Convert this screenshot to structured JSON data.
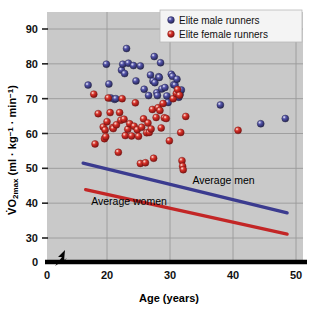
{
  "chart_data": {
    "type": "scatter",
    "title": "",
    "xlabel": "Age (years)",
    "ylabel": "VO2max (ml · kg-1 · min-1)",
    "ylabel_parts": {
      "v": "V",
      "o": "O",
      "sub": "2max",
      "rest": " (ml · kg",
      "sup1": "-1",
      "mid": " · min",
      "sup2": "-1",
      "close": ")"
    },
    "xlim": [
      0,
      51
    ],
    "ylim": [
      0,
      95
    ],
    "x_break_after": 0,
    "y_break_after": 0,
    "xticks": [
      0,
      20,
      30,
      40,
      50
    ],
    "xtick_labels": [
      "0",
      "20",
      "30",
      "40",
      "50"
    ],
    "yticks": [
      0,
      30,
      40,
      50,
      60,
      70,
      80,
      90
    ],
    "ytick_labels": [
      "0",
      "30",
      "40",
      "50",
      "60",
      "70",
      "80",
      "90"
    ],
    "grid": true,
    "grid_color": "#9a9a9a",
    "plot_background": "#c9c9c9",
    "legend_position": "top-right",
    "legend": [
      {
        "name": "Elite male runners",
        "color": "#3b3b8f"
      },
      {
        "name": "Elite female runners",
        "color": "#c32626"
      }
    ],
    "annotations": [
      {
        "text": "Average men",
        "x": 38.5,
        "y": 45.5
      },
      {
        "text": "Average women",
        "x": 23.5,
        "y": 39.5
      }
    ],
    "series": [
      {
        "name": "Elite male runners",
        "color": "#3b3b8f",
        "points": [
          [
            17.0,
            73.9
          ],
          [
            19.9,
            79.9
          ],
          [
            20.3,
            74.2
          ],
          [
            20.6,
            70.2
          ],
          [
            21.2,
            69.8
          ],
          [
            21.4,
            70.0
          ],
          [
            22.3,
            78.2
          ],
          [
            22.5,
            79.9
          ],
          [
            22.8,
            77.2
          ],
          [
            23.1,
            84.4
          ],
          [
            23.4,
            80.2
          ],
          [
            24.2,
            79.5
          ],
          [
            24.6,
            75.1
          ],
          [
            25.3,
            79.4
          ],
          [
            25.9,
            72.7
          ],
          [
            26.6,
            70.9
          ],
          [
            26.9,
            76.8
          ],
          [
            27.3,
            75.1
          ],
          [
            27.5,
            82.1
          ],
          [
            27.6,
            74.6
          ],
          [
            27.9,
            71.7
          ],
          [
            28.0,
            70.9
          ],
          [
            28.2,
            76.3
          ],
          [
            28.3,
            76.1
          ],
          [
            28.5,
            80.3
          ],
          [
            28.7,
            72.8
          ],
          [
            29.2,
            73.2
          ],
          [
            29.5,
            70.8
          ],
          [
            29.7,
            68.9
          ],
          [
            30.2,
            77.0
          ],
          [
            30.4,
            76.4
          ],
          [
            30.6,
            74.0
          ],
          [
            30.8,
            73.9
          ],
          [
            31.1,
            75.6
          ],
          [
            31.3,
            71.8
          ],
          [
            31.4,
            70.4
          ],
          [
            31.6,
            71.2
          ],
          [
            31.8,
            72.5
          ],
          [
            38.0,
            68.2
          ],
          [
            44.4,
            62.8
          ],
          [
            48.3,
            64.3
          ]
        ]
      },
      {
        "name": "Elite female runners",
        "color": "#c32626",
        "points": [
          [
            17.9,
            71.3
          ],
          [
            18.1,
            57.0
          ],
          [
            18.6,
            65.7
          ],
          [
            19.4,
            61.9
          ],
          [
            19.6,
            58.5
          ],
          [
            19.7,
            61.0
          ],
          [
            19.8,
            59.1
          ],
          [
            20.0,
            63.4
          ],
          [
            20.2,
            70.2
          ],
          [
            20.5,
            66.0
          ],
          [
            20.9,
            61.7
          ],
          [
            21.0,
            61.4
          ],
          [
            21.5,
            62.5
          ],
          [
            21.8,
            54.6
          ],
          [
            22.0,
            66.0
          ],
          [
            22.2,
            63.8
          ],
          [
            22.4,
            70.0
          ],
          [
            22.7,
            64.1
          ],
          [
            22.9,
            59.4
          ],
          [
            23.3,
            61.2
          ],
          [
            23.6,
            62.8
          ],
          [
            23.9,
            59.3
          ],
          [
            24.3,
            62.1
          ],
          [
            24.5,
            68.8
          ],
          [
            24.8,
            61.1
          ],
          [
            25.0,
            59.2
          ],
          [
            25.3,
            51.4
          ],
          [
            25.5,
            61.8
          ],
          [
            25.8,
            64.2
          ],
          [
            26.1,
            51.6
          ],
          [
            26.3,
            60.2
          ],
          [
            26.5,
            63.0
          ],
          [
            26.7,
            60.3
          ],
          [
            27.0,
            61.3
          ],
          [
            27.2,
            66.9
          ],
          [
            27.4,
            52.9
          ],
          [
            27.8,
            64.6
          ],
          [
            28.1,
            67.4
          ],
          [
            28.4,
            66.6
          ],
          [
            28.6,
            61.6
          ],
          [
            28.9,
            68.6
          ],
          [
            29.1,
            64.5
          ],
          [
            29.4,
            64.3
          ],
          [
            29.9,
            57.9
          ],
          [
            30.5,
            70.0
          ],
          [
            31.0,
            71.5
          ],
          [
            31.2,
            72.6
          ],
          [
            31.5,
            71.0
          ],
          [
            31.7,
            60.3
          ],
          [
            31.9,
            52.2
          ],
          [
            32.0,
            50.6
          ],
          [
            32.1,
            49.6
          ],
          [
            32.5,
            64.9
          ],
          [
            40.8,
            60.9
          ]
        ]
      }
    ],
    "trend_lines": [
      {
        "name": "Average men",
        "color": "#3b3b8f",
        "x": [
          16.2,
          48.6
        ],
        "y": [
          51.5,
          37.2
        ]
      },
      {
        "name": "Average women",
        "color": "#c32626",
        "x": [
          16.6,
          48.6
        ],
        "y": [
          43.9,
          31.1
        ]
      }
    ]
  }
}
